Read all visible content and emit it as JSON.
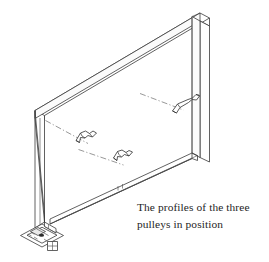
{
  "figure": {
    "kind": "isometric-line-drawing",
    "background_color": "#ffffff",
    "line_color": "#3a3a3a",
    "centerline_color": "#6b6b6b"
  },
  "caption": {
    "line1": "The profiles of the three",
    "line2": "pulleys in position",
    "full_text": "The profiles of the three pulleys in position",
    "color": "#252525"
  },
  "components": {
    "frame": {
      "label": "Rectangular frame",
      "members": [
        {
          "name": "top-rail",
          "orientation": "diagonal-up-right"
        },
        {
          "name": "left-post",
          "orientation": "vertical"
        },
        {
          "name": "right-post",
          "orientation": "vertical"
        },
        {
          "name": "bottom-rail",
          "orientation": "diagonal-down-left"
        }
      ]
    },
    "pulleys": [
      {
        "name": "pulley-profile-1",
        "position": "left",
        "has_centerline": true
      },
      {
        "name": "pulley-profile-2",
        "position": "middle",
        "has_centerline": true
      },
      {
        "name": "pulley-profile-3",
        "position": "right",
        "has_centerline": true
      }
    ],
    "base": {
      "name": "base-plate-foot",
      "position": "bottom-left",
      "features": [
        "mounting-hole",
        "bolt-detail"
      ]
    }
  }
}
